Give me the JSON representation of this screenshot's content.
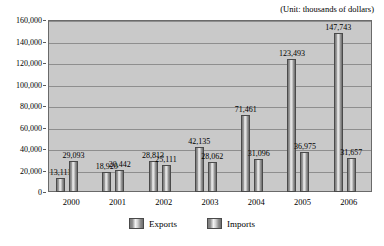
{
  "unit_note": "(Unit: thousands of dollars)",
  "legend": {
    "exports_label": "Exports",
    "imports_label": "Imports"
  },
  "axis": {
    "zero_label": "0",
    "y_ticks": [
      "160,000",
      "140,000",
      "120,000",
      "100,000",
      "80,000",
      "60,000",
      "40,000",
      "20,000",
      "0"
    ]
  },
  "chart_data": {
    "type": "bar",
    "title": "",
    "subtitle": "",
    "annotations": [
      "(Unit: thousands of dollars)"
    ],
    "categories": [
      "2000",
      "2001",
      "2002",
      "2003",
      "2004",
      "2005",
      "2006"
    ],
    "series": [
      {
        "name": "Exports",
        "values": [
          13111,
          18920,
          28813,
          42135,
          71461,
          123493,
          147743
        ],
        "labels": [
          "13,111",
          "18,920",
          "28,813",
          "42,135",
          "71,461",
          "123,493",
          "147,743"
        ]
      },
      {
        "name": "Imports",
        "values": [
          29093,
          20442,
          25111,
          28062,
          31096,
          36975,
          31657
        ],
        "labels": [
          "29,093",
          "20,442",
          "25,111",
          "28,062",
          "31,096",
          "36,975",
          "31,657"
        ]
      }
    ],
    "xlabel": "",
    "ylabel": "",
    "ylim": [
      0,
      160000
    ],
    "ytick_values": [
      0,
      20000,
      40000,
      60000,
      80000,
      100000,
      120000,
      140000,
      160000
    ],
    "ytick_labels": [
      "0",
      "20,000",
      "40,000",
      "60,000",
      "80,000",
      "100,000",
      "120,000",
      "140,000",
      "160,000"
    ],
    "grid": true,
    "grid_axis": "y",
    "legend_position": "bottom",
    "plot_background": "#c9c9c9",
    "bar_color": "#9a9a9a"
  }
}
